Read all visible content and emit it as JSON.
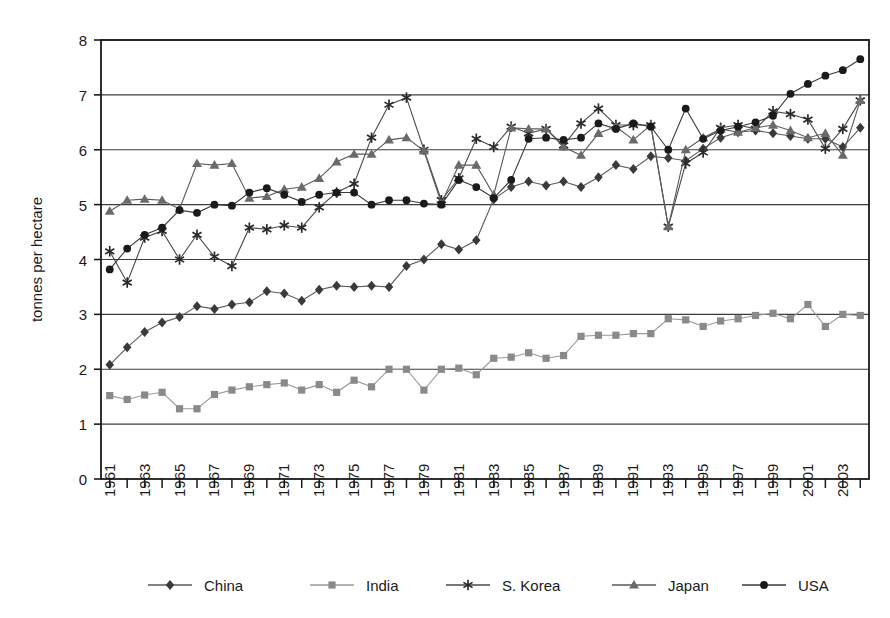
{
  "chart_data": {
    "type": "line",
    "title": "",
    "xlabel": "",
    "ylabel": "tonnes per hectare",
    "ylim": [
      0,
      8
    ],
    "ytick_labels": [
      "0",
      "1",
      "2",
      "3",
      "4",
      "5",
      "6",
      "7",
      "8"
    ],
    "grid": true,
    "legend_position": "bottom",
    "x": [
      1961,
      1962,
      1963,
      1964,
      1965,
      1966,
      1967,
      1968,
      1969,
      1970,
      1971,
      1972,
      1973,
      1974,
      1975,
      1976,
      1977,
      1978,
      1979,
      1980,
      1981,
      1982,
      1983,
      1984,
      1985,
      1986,
      1987,
      1988,
      1989,
      1990,
      1991,
      1992,
      1993,
      1994,
      1995,
      1996,
      1997,
      1998,
      1999,
      2000,
      2001,
      2002,
      2003,
      2004
    ],
    "xtick_labels": [
      "1961",
      "1963",
      "1965",
      "1967",
      "1969",
      "1971",
      "1973",
      "1975",
      "1977",
      "1979",
      "1981",
      "1983",
      "1985",
      "1987",
      "1989",
      "1991",
      "1993",
      "1995",
      "1997",
      "1999",
      "2001",
      "2003"
    ],
    "series": [
      {
        "name": "China",
        "marker": "diamond",
        "color": "#3a3a3a",
        "line_color": "#5a5a5a",
        "values": [
          2.08,
          2.4,
          2.68,
          2.85,
          2.95,
          3.15,
          3.1,
          3.18,
          3.22,
          3.42,
          3.38,
          3.25,
          3.45,
          3.52,
          3.5,
          3.52,
          3.5,
          3.88,
          4.0,
          4.28,
          4.18,
          4.35,
          5.1,
          5.32,
          5.42,
          5.35,
          5.42,
          5.32,
          5.5,
          5.72,
          5.65,
          5.88,
          5.85,
          5.8,
          6.02,
          6.22,
          6.32,
          6.35,
          6.3,
          6.25,
          6.2,
          6.2,
          6.05,
          6.4
        ]
      },
      {
        "name": "India",
        "marker": "square",
        "color": "#8a8a8a",
        "line_color": "#9a9a9a",
        "values": [
          1.52,
          1.45,
          1.53,
          1.58,
          1.28,
          1.28,
          1.54,
          1.62,
          1.68,
          1.72,
          1.75,
          1.62,
          1.72,
          1.58,
          1.8,
          1.68,
          2.0,
          2.0,
          1.62,
          2.0,
          2.02,
          1.9,
          2.2,
          2.22,
          2.3,
          2.2,
          2.25,
          2.6,
          2.62,
          2.62,
          2.65,
          2.65,
          2.92,
          2.9,
          2.78,
          2.88,
          2.92,
          2.98,
          3.02,
          2.92,
          3.18,
          2.78,
          3.0,
          2.98
        ]
      },
      {
        "name": "S. Korea",
        "marker": "asterisk",
        "color": "#2a2a2a",
        "line_color": "#4a4a4a",
        "values": [
          4.15,
          3.58,
          4.4,
          4.52,
          4.0,
          4.45,
          4.05,
          3.88,
          4.58,
          4.55,
          4.62,
          4.58,
          4.95,
          5.22,
          5.38,
          6.22,
          6.82,
          6.95,
          6.0,
          5.08,
          5.48,
          6.2,
          6.05,
          6.42,
          6.3,
          6.38,
          6.08,
          6.48,
          6.75,
          6.45,
          6.45,
          6.45,
          4.6,
          5.75,
          5.95,
          6.4,
          6.45,
          6.38,
          6.7,
          6.65,
          6.55,
          6.02,
          6.38,
          6.9
        ]
      },
      {
        "name": "Japan",
        "marker": "triangle",
        "color": "#6a6a6a",
        "line_color": "#5a5a5a",
        "values": [
          4.88,
          5.08,
          5.1,
          5.08,
          4.92,
          5.75,
          5.72,
          5.75,
          5.12,
          5.15,
          5.28,
          5.32,
          5.48,
          5.78,
          5.92,
          5.92,
          6.18,
          6.22,
          5.98,
          5.02,
          5.72,
          5.72,
          5.18,
          6.4,
          6.38,
          6.38,
          6.05,
          5.9,
          6.3,
          6.42,
          6.18,
          6.45,
          4.6,
          6.0,
          6.22,
          6.38,
          6.32,
          6.4,
          6.45,
          6.35,
          6.22,
          6.3,
          5.9,
          6.9
        ]
      },
      {
        "name": "USA",
        "marker": "circle",
        "color": "#1a1a1a",
        "line_color": "#3a3a3a",
        "values": [
          3.82,
          4.2,
          4.45,
          4.58,
          4.9,
          4.85,
          5.0,
          4.98,
          5.22,
          5.3,
          5.18,
          5.05,
          5.18,
          5.22,
          5.22,
          5.0,
          5.08,
          5.08,
          5.02,
          5.0,
          5.45,
          5.32,
          5.12,
          5.45,
          6.2,
          6.22,
          6.18,
          6.22,
          6.48,
          6.38,
          6.48,
          6.42,
          6.0,
          6.75,
          6.2,
          6.35,
          6.42,
          6.5,
          6.62,
          7.02,
          7.2,
          7.35,
          7.45,
          7.65
        ]
      }
    ]
  }
}
